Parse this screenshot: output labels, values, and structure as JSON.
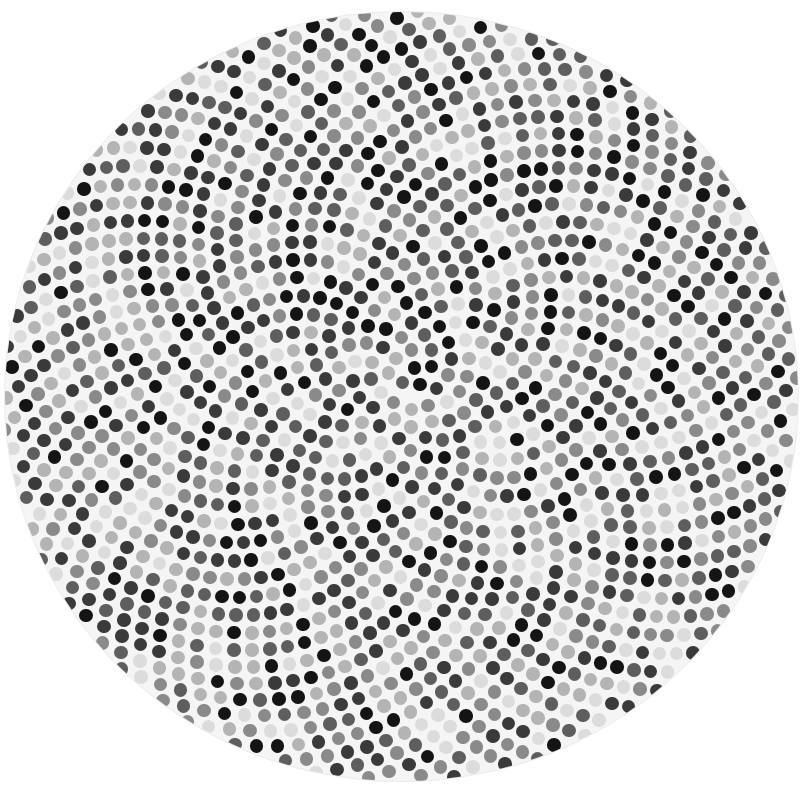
{
  "artwork": {
    "title": "Dot circle painting",
    "canvas": {
      "background": "#ffffff",
      "disc_fill": "#f5f5f5",
      "disc_center_x": 401,
      "disc_center_y": 396,
      "disc_radius_x": 396,
      "disc_radius_y": 384
    },
    "dots": {
      "arrangement": "phyllotaxis-spiral",
      "count": 1560,
      "diameter": 13.5,
      "spacing": 10.1,
      "golden_angle_deg": 137.508,
      "palette": [
        "#141414",
        "#3a3a3a",
        "#5e5e5e",
        "#8a8a8a",
        "#b4b4b4",
        "#dcdcdc"
      ],
      "shade_weights": [
        0.14,
        0.2,
        0.16,
        0.18,
        0.17,
        0.15
      ],
      "seed": 20240
    }
  }
}
